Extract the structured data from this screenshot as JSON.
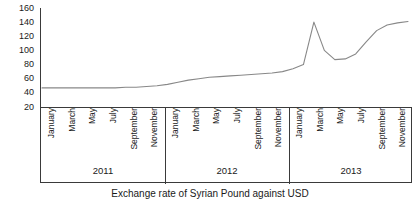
{
  "chart_data": {
    "type": "line",
    "title": "Exchange rate of Syrian Pound against USD",
    "xlabel": "",
    "ylabel": "",
    "ylim": [
      20,
      160
    ],
    "yticks": [
      160,
      140,
      120,
      100,
      80,
      60,
      40,
      20
    ],
    "grid": false,
    "legend": "none",
    "axis_frame": "left-spine-only",
    "x_group_label": "year",
    "categories": [
      "January 2011",
      "February 2011",
      "March 2011",
      "April 2011",
      "May 2011",
      "June 2011",
      "July 2011",
      "August 2011",
      "September 2011",
      "October 2011",
      "November 2011",
      "December 2011",
      "January 2012",
      "February 2012",
      "March 2012",
      "April 2012",
      "May 2012",
      "June 2012",
      "July 2012",
      "August 2012",
      "September 2012",
      "October 2012",
      "November 2012",
      "December 2012",
      "January 2013",
      "February 2013",
      "March 2013",
      "April 2013",
      "May 2013",
      "June 2013",
      "July 2013",
      "August 2013",
      "September 2013",
      "October 2013",
      "November 2013",
      "December 2013"
    ],
    "tick_labels": [
      "January",
      "March",
      "May",
      "July",
      "September",
      "November"
    ],
    "values": [
      47,
      47,
      47,
      47,
      47,
      47,
      47,
      47,
      48,
      48,
      49,
      50,
      52,
      55,
      58,
      60,
      62,
      63,
      64,
      65,
      66,
      67,
      68,
      70,
      74,
      80,
      140,
      100,
      87,
      88,
      95,
      112,
      128,
      136,
      139,
      141
    ],
    "series_name": "Syrian Pound per USD",
    "line_color": "#888888",
    "annotations": [
      {
        "label": "peak",
        "x": "March 2013",
        "y": 140
      },
      {
        "label": "trough after peak",
        "x": "May 2013",
        "y": 87
      }
    ],
    "years": [
      {
        "label": "2011",
        "months": [
          "January",
          "March",
          "May",
          "July",
          "September",
          "November"
        ]
      },
      {
        "label": "2012",
        "months": [
          "January",
          "March",
          "May",
          "July",
          "September",
          "November"
        ]
      },
      {
        "label": "2013",
        "months": [
          "January",
          "March",
          "May",
          "July",
          "September",
          "November"
        ]
      }
    ]
  },
  "caption": {
    "text": "Exchange rate of Syrian Pound against USD"
  },
  "colors": {
    "line": "#888888",
    "axis": "#3a3a3a",
    "text": "#1a1a1a",
    "background": "#ffffff"
  }
}
